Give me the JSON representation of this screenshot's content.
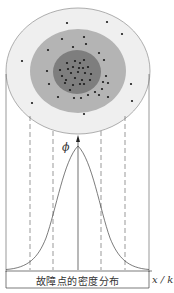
{
  "figure": {
    "caption": "故障点的密度分布",
    "x_axis_label": "x / km",
    "y_axis_label": "ϕ",
    "colors": {
      "outer_ring": "#efefef",
      "middle_ring": "#b4b4b4",
      "inner_core": "#7e7e7e",
      "outline": "#9a9a9a",
      "dots": "#1a1a1a",
      "lines": "#555555"
    },
    "regions": [
      {
        "name": "outer",
        "description": "low-density fault region"
      },
      {
        "name": "middle",
        "description": "medium-density fault region"
      },
      {
        "name": "inner",
        "description": "high-density fault region"
      }
    ],
    "curve": "normal distribution (bell curve) of fault point density"
  }
}
